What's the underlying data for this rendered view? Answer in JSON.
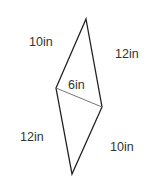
{
  "diagram": {
    "type": "quadrilateral-with-diagonal",
    "stroke_color": "#222222",
    "diagonal_color": "#555555",
    "vertices": {
      "top": [
        86,
        19
      ],
      "left": [
        56,
        88
      ],
      "right": [
        102,
        107
      ],
      "bottom": [
        72,
        174
      ]
    },
    "labels": {
      "top_left_side": "10in",
      "top_right_side": "12in",
      "diagonal": "6in",
      "bottom_left_side": "12in",
      "bottom_right_side": "10in"
    }
  }
}
